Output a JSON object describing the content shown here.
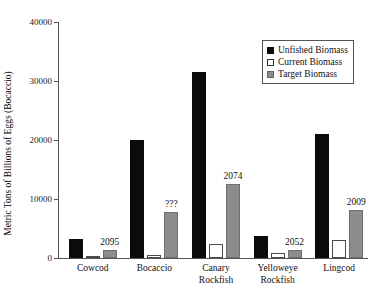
{
  "chart_data": {
    "type": "bar",
    "title": "",
    "subtitle": "",
    "xlabel": "",
    "ylabel": "Metric Tons of Billions of Eggs (Bocaccio)",
    "ylim": [
      0,
      40000
    ],
    "yticks": [
      0,
      10000,
      20000,
      30000,
      40000
    ],
    "ytick_labels": [
      "0",
      "10000",
      "20000",
      "30000",
      "40000"
    ],
    "grid": false,
    "legend_position": "top-right",
    "categories": [
      "Cowcod",
      "Bocaccio",
      "Canary\nRockfish",
      "Yelloweye\nRockfish",
      "Lingcod"
    ],
    "series": [
      {
        "name": "Unfished Biomass",
        "color": "#0b0b0b",
        "values": [
          3200,
          20000,
          31500,
          3800,
          21000
        ]
      },
      {
        "name": "Current Biomass",
        "color": "#ffffff",
        "values": [
          300,
          500,
          2400,
          800,
          3000
        ]
      },
      {
        "name": "Target Biomass",
        "color": "#8c8c8c",
        "values": [
          1300,
          7800,
          12500,
          1400,
          8200
        ]
      }
    ],
    "annotations": [
      {
        "category": "Cowcod",
        "text": "2095",
        "value": 1300
      },
      {
        "category": "Bocaccio",
        "text": "???",
        "value": 7800
      },
      {
        "category": "Canary Rockfish",
        "text": "2074",
        "value": 12500
      },
      {
        "category": "Yelloweye Rockfish",
        "text": "2052",
        "value": 1400
      },
      {
        "category": "Lingcod",
        "text": "2009",
        "value": 8200
      }
    ]
  }
}
